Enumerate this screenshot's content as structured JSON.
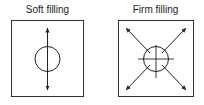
{
  "panels": [
    {
      "title": "Soft filling",
      "description": "single vertical double-headed arrow through circle"
    },
    {
      "title": "Firm filling",
      "description": "four diagonal arrows outward from circle with crosshair"
    }
  ],
  "colors": {
    "stroke": "#222222",
    "background": "#ffffff"
  }
}
